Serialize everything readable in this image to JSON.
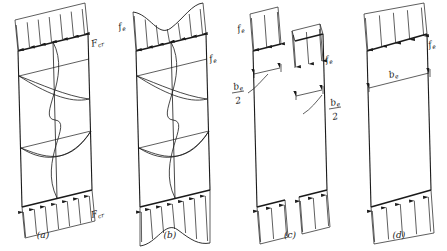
{
  "figure": {
    "panels": [
      {
        "id": "a",
        "caption": "(a)",
        "top_label": "F",
        "top_label_sub": "cr",
        "bottom_label": "F",
        "bottom_label_sub": "cr",
        "description": "Uniform critical stress distribution on buckled plate with deflected shape",
        "stress_profile": "uniform",
        "arrow_count_top": 7,
        "arrow_count_bottom": 7,
        "has_buckled_shape": true
      },
      {
        "id": "b",
        "caption": "(b)",
        "top_label": "f",
        "top_label_sub": "e",
        "right_label": "f",
        "right_label_sub": "e",
        "description": "Actual non-uniform stress distribution after buckling, higher at edges",
        "stress_profile": "non-uniform-edge-peaked",
        "arrow_count_top": 7,
        "arrow_count_bottom": 7,
        "has_buckled_shape": true
      },
      {
        "id": "c",
        "caption": "(c)",
        "left_label": "f",
        "left_label_sub": "e",
        "right_label": "f",
        "right_label_sub": "e",
        "dim_left_numerator": "b",
        "dim_left_sub": "e",
        "dim_left_denominator": "2",
        "dim_right_numerator": "b",
        "dim_right_sub": "e",
        "dim_right_denominator": "2",
        "description": "Equivalent uniform stress acting on two effective strips of width b-e over 2",
        "stress_profile": "two-edge-strips",
        "arrow_count_strip": 3,
        "has_buckled_shape": false
      },
      {
        "id": "d",
        "caption": "(d)",
        "right_label": "f",
        "right_label_sub": "e",
        "dim_label": "b",
        "dim_label_sub": "e",
        "description": "Combined effective width b-e carrying uniform stress f-e",
        "stress_profile": "single-effective-band",
        "arrow_count_top": 5,
        "arrow_count_bottom": 5,
        "has_buckled_shape": false
      }
    ],
    "colors": {
      "ink": "#1a1a1a",
      "background": "#ffffff"
    }
  }
}
